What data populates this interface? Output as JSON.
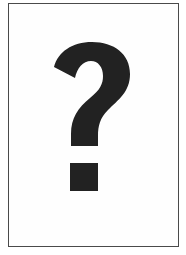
{
  "card": {
    "symbol": "?",
    "symbol_label": "question-mark",
    "colors": {
      "border": "#4a4a4a",
      "background": "#fefefe",
      "glyph": "#222222"
    }
  }
}
